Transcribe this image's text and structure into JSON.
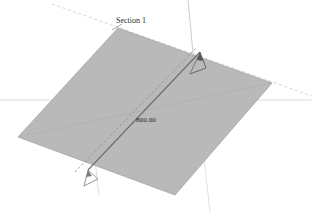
{
  "canvas": {
    "width": 312,
    "height": 213,
    "background_color": "#ffffff"
  },
  "drawing": {
    "type": "3d-section-view",
    "plane": {
      "name": "section-plane",
      "fill_color": "#b9b9b9",
      "edge_color": "#9a9a9a",
      "points": "118,28 272,83 175,195 18,137"
    },
    "section_line": {
      "name": "section-cut-line",
      "color": "#6f6f6f",
      "start_x": 88,
      "start_y": 170,
      "end_x": 200,
      "end_y": 52
    },
    "section_line_offset": {
      "name": "section-offset-line",
      "color": "#8e8e8e",
      "start_x": 75,
      "start_y": 172,
      "end_x": 196,
      "end_y": 48
    },
    "axis_lines": [
      {
        "name": "axis-horizontal",
        "color": "#d8d8d8",
        "x1": 0,
        "y1": 100,
        "x2": 312,
        "y2": 100
      },
      {
        "name": "axis-diagonal-upper-left",
        "color": "#cfcfcf",
        "x1": 52,
        "y1": 4,
        "x2": 312,
        "y2": 96
      },
      {
        "name": "axis-vertical-right",
        "color": "#d2d2d2",
        "x1": 188,
        "y1": 0,
        "x2": 208,
        "y2": 213
      }
    ],
    "markers": [
      {
        "name": "section-arrow-start",
        "color": "#6a6a6a",
        "x": 88,
        "y": 170
      },
      {
        "name": "section-arrow-end",
        "color": "#5d5d5d",
        "x": 200,
        "y": 52
      }
    ]
  },
  "labels": {
    "section_name": "Section 1",
    "dimension_value": "800.00"
  }
}
